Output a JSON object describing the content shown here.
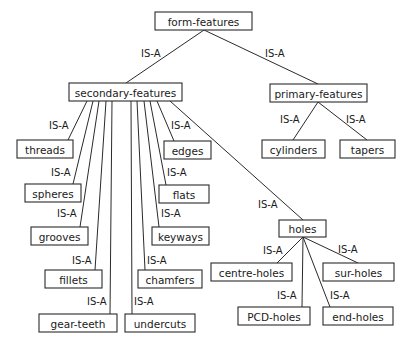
{
  "diagram": {
    "relation_label": "IS-A",
    "nodes": [
      {
        "id": "form-features",
        "label": "form-features",
        "x": 155,
        "y": 12,
        "w": 97,
        "h": 18
      },
      {
        "id": "secondary-features",
        "label": "secondary-features",
        "x": 69,
        "y": 83,
        "w": 113,
        "h": 18
      },
      {
        "id": "primary-features",
        "label": "primary-features",
        "x": 270,
        "y": 84,
        "w": 97,
        "h": 18
      },
      {
        "id": "threads",
        "label": "threads",
        "x": 17,
        "y": 140,
        "w": 56,
        "h": 18
      },
      {
        "id": "edges",
        "label": "edges",
        "x": 164,
        "y": 141,
        "w": 47,
        "h": 18
      },
      {
        "id": "spheres",
        "label": "spheres",
        "x": 25,
        "y": 184,
        "w": 56,
        "h": 18
      },
      {
        "id": "flats",
        "label": "flats",
        "x": 159,
        "y": 185,
        "w": 50,
        "h": 18
      },
      {
        "id": "grooves",
        "label": "grooves",
        "x": 31,
        "y": 227,
        "w": 57,
        "h": 18
      },
      {
        "id": "keyways",
        "label": "keyways",
        "x": 152,
        "y": 227,
        "w": 57,
        "h": 18
      },
      {
        "id": "fillets",
        "label": "fillets",
        "x": 45,
        "y": 270,
        "w": 57,
        "h": 18
      },
      {
        "id": "chamfers",
        "label": "chamfers",
        "x": 138,
        "y": 270,
        "w": 64,
        "h": 18
      },
      {
        "id": "gear-teeth",
        "label": "gear-teeth",
        "x": 39,
        "y": 314,
        "w": 78,
        "h": 18
      },
      {
        "id": "undercuts",
        "label": "undercuts",
        "x": 125,
        "y": 314,
        "w": 70,
        "h": 18
      },
      {
        "id": "cylinders",
        "label": "cylinders",
        "x": 262,
        "y": 140,
        "w": 63,
        "h": 18
      },
      {
        "id": "tapers",
        "label": "tapers",
        "x": 340,
        "y": 140,
        "w": 55,
        "h": 18
      },
      {
        "id": "holes",
        "label": "holes",
        "x": 279,
        "y": 220,
        "w": 47,
        "h": 17
      },
      {
        "id": "centre-holes",
        "label": "centre-holes",
        "x": 211,
        "y": 263,
        "w": 81,
        "h": 18
      },
      {
        "id": "sur-holes",
        "label": "sur-holes",
        "x": 323,
        "y": 263,
        "w": 71,
        "h": 18
      },
      {
        "id": "PCD-holes",
        "label": "PCD-holes",
        "x": 238,
        "y": 307,
        "w": 72,
        "h": 18
      },
      {
        "id": "end-holes",
        "label": "end-holes",
        "x": 323,
        "y": 307,
        "w": 70,
        "h": 18
      }
    ],
    "edges": [
      {
        "from": "form-features",
        "to": "secondary-features",
        "x1": 204,
        "y1": 30,
        "x2": 126,
        "y2": 83,
        "label": "IS-A",
        "lx": 141,
        "ly": 53
      },
      {
        "from": "form-features",
        "to": "primary-features",
        "x1": 204,
        "y1": 30,
        "x2": 318,
        "y2": 84,
        "label": "IS-A",
        "lx": 265,
        "ly": 53
      },
      {
        "from": "primary-features",
        "to": "cylinders",
        "x1": 318,
        "y1": 102,
        "x2": 293,
        "y2": 140,
        "label": "IS-A",
        "lx": 280,
        "ly": 119
      },
      {
        "from": "primary-features",
        "to": "tapers",
        "x1": 318,
        "y1": 102,
        "x2": 367,
        "y2": 140,
        "label": "IS-A",
        "lx": 346,
        "ly": 119
      },
      {
        "from": "secondary-features",
        "to": "threads",
        "x1": 87,
        "y1": 101,
        "x2": 68,
        "y2": 140,
        "label": "IS-A",
        "lx": 49,
        "ly": 125
      },
      {
        "from": "secondary-features",
        "to": "spheres",
        "x1": 93,
        "y1": 101,
        "x2": 73,
        "y2": 184,
        "label": "IS-A",
        "lx": 51,
        "ly": 172
      },
      {
        "from": "secondary-features",
        "to": "grooves",
        "x1": 99,
        "y1": 101,
        "x2": 80,
        "y2": 227,
        "label": "IS-A",
        "lx": 57,
        "ly": 213
      },
      {
        "from": "secondary-features",
        "to": "fillets",
        "x1": 106,
        "y1": 101,
        "x2": 95,
        "y2": 270,
        "label": "IS-A",
        "lx": 72,
        "ly": 260
      },
      {
        "from": "secondary-features",
        "to": "gear-teeth",
        "x1": 112,
        "y1": 101,
        "x2": 110,
        "y2": 314,
        "label": "IS-A",
        "lx": 87,
        "ly": 301
      },
      {
        "from": "secondary-features",
        "to": "undercuts",
        "x1": 131,
        "y1": 101,
        "x2": 132,
        "y2": 314,
        "label": "IS-A",
        "lx": 134,
        "ly": 301
      },
      {
        "from": "secondary-features",
        "to": "chamfers",
        "x1": 137,
        "y1": 101,
        "x2": 145,
        "y2": 270,
        "label": "IS-A",
        "lx": 147,
        "ly": 260
      },
      {
        "from": "secondary-features",
        "to": "keyways",
        "x1": 144,
        "y1": 101,
        "x2": 159,
        "y2": 227,
        "label": "IS-A",
        "lx": 161,
        "ly": 213
      },
      {
        "from": "secondary-features",
        "to": "flats",
        "x1": 150,
        "y1": 101,
        "x2": 166,
        "y2": 185,
        "label": "IS-A",
        "lx": 167,
        "ly": 172
      },
      {
        "from": "secondary-features",
        "to": "edges",
        "x1": 157,
        "y1": 101,
        "x2": 174,
        "y2": 141,
        "label": "IS-A",
        "lx": 171,
        "ly": 125
      },
      {
        "from": "secondary-features",
        "to": "holes",
        "x1": 170,
        "y1": 101,
        "x2": 303,
        "y2": 220,
        "label": "IS-A",
        "lx": 258,
        "ly": 204
      },
      {
        "from": "holes",
        "to": "centre-holes",
        "x1": 303,
        "y1": 237,
        "x2": 277,
        "y2": 263,
        "label": "IS-A",
        "lx": 263,
        "ly": 250
      },
      {
        "from": "holes",
        "to": "sur-holes",
        "x1": 303,
        "y1": 237,
        "x2": 358,
        "y2": 263,
        "label": "IS-A",
        "lx": 338,
        "ly": 249
      },
      {
        "from": "holes",
        "to": "PCD-holes",
        "x1": 303,
        "y1": 237,
        "x2": 302,
        "y2": 307,
        "label": "IS-A",
        "lx": 277,
        "ly": 295
      },
      {
        "from": "holes",
        "to": "end-holes",
        "x1": 303,
        "y1": 237,
        "x2": 330,
        "y2": 307,
        "label": "IS-A",
        "lx": 330,
        "ly": 295
      }
    ]
  }
}
